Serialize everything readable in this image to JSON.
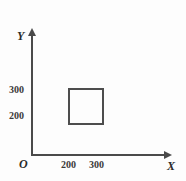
{
  "figure": {
    "background_color": "#fdfdfd",
    "axis_color": "#4a4a4a",
    "shape_color": "#4d4d4d",
    "origin_label": "O",
    "x_axis": {
      "name": "X",
      "ticks": [
        "200",
        "300"
      ]
    },
    "y_axis": {
      "name": "Y",
      "ticks": [
        "300",
        "200"
      ]
    }
  },
  "chart_data": {
    "type": "scatter",
    "title": "",
    "xlabel": "X",
    "ylabel": "Y",
    "xlim": [
      0,
      400
    ],
    "ylim": [
      0,
      400
    ],
    "xticks": [
      200,
      300
    ],
    "yticks": [
      200,
      300
    ],
    "xtick_labels": [
      "200",
      "300"
    ],
    "ytick_labels": [
      "200",
      "300"
    ],
    "grid": false,
    "legend": null,
    "origin_label": "O",
    "annotations": [
      {
        "kind": "rectangle",
        "label": "square-region",
        "x_min": 200,
        "x_max": 300,
        "y_min": 200,
        "y_max": 300,
        "filled": false,
        "edge_color": "#4d4d4d"
      }
    ]
  }
}
